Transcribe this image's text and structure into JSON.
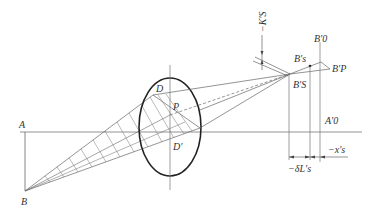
{
  "diagram": {
    "type": "optical-ray-diagram",
    "labels": {
      "A": "A",
      "B": "B",
      "D_upper": "D",
      "D_lower": "D′",
      "P": "P",
      "Bs": "B′s",
      "BS": "B′S",
      "B0": "B′0",
      "Bp": "B′P",
      "A0": "A′0",
      "Ks": "−K′S",
      "dL": "−δL′s",
      "xs": "−x′s"
    },
    "colors": {
      "line": "#555555",
      "lens": "#222222",
      "hatch": "#666666"
    }
  }
}
